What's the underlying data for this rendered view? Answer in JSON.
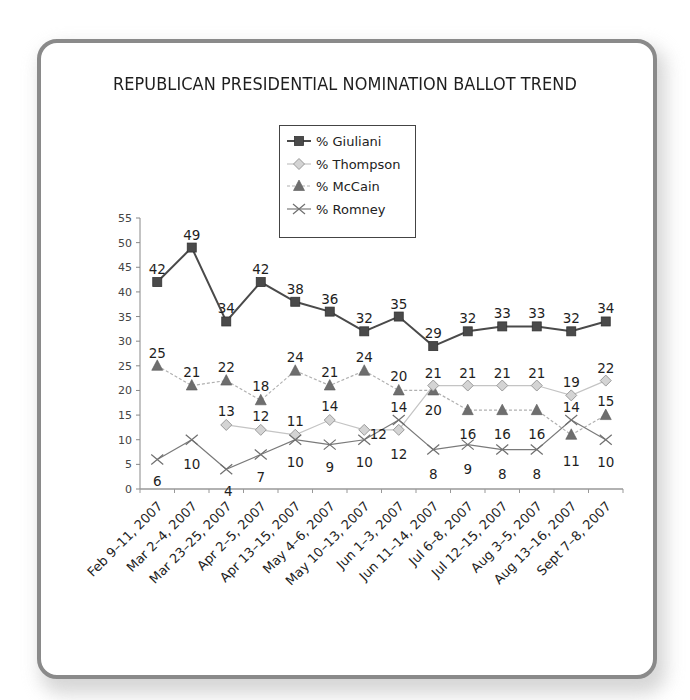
{
  "chart_data": {
    "type": "line",
    "title": "REPUBLICAN PRESIDENTIAL NOMINATION BALLOT TREND",
    "xlabel": "",
    "ylabel": "",
    "ylim": [
      0,
      55
    ],
    "yticks": [
      0,
      5,
      10,
      15,
      20,
      25,
      30,
      35,
      40,
      45,
      50,
      55
    ],
    "grid": false,
    "legend_position": "top-center",
    "categories": [
      "Feb 9–11, 2007",
      "Mar 2–4, 2007",
      "Mar 23–25, 2007",
      "Apr 2–5, 2007",
      "Apr 13–15, 2007",
      "May 4–6, 2007",
      "May 10–13, 2007",
      "Jun 1–3, 2007",
      "Jun 11–14, 2007",
      "Jul 6–8, 2007",
      "Jul 12–15, 2007",
      "Aug 3–5, 2007",
      "Aug 13–16, 2007",
      "Sept 7–8, 2007"
    ],
    "series": [
      {
        "name": "% Giuliani",
        "marker": "square",
        "color": "#4a4a4a",
        "line": "solid",
        "values": [
          42,
          49,
          34,
          42,
          38,
          36,
          32,
          35,
          29,
          32,
          33,
          33,
          32,
          34
        ]
      },
      {
        "name": "% Thompson",
        "marker": "diamond",
        "color": "#bdbdbd",
        "line": "solid",
        "values": [
          null,
          null,
          13,
          12,
          11,
          14,
          12,
          12,
          21,
          21,
          21,
          21,
          19,
          22
        ]
      },
      {
        "name": "% McCain",
        "marker": "triangle",
        "color": "#6e6e6e",
        "line": "dashed",
        "values": [
          25,
          21,
          22,
          18,
          24,
          21,
          24,
          20,
          20,
          16,
          16,
          16,
          11,
          15
        ]
      },
      {
        "name": "% Romney",
        "marker": "x",
        "color": "#7a7a7a",
        "line": "solid",
        "values": [
          6,
          10,
          4,
          7,
          10,
          9,
          10,
          14,
          8,
          9,
          8,
          8,
          14,
          10
        ]
      }
    ]
  }
}
